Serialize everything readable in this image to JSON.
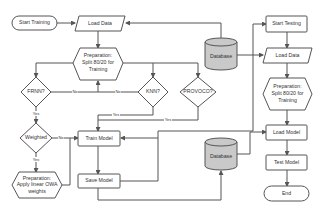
{
  "diagram": {
    "type": "flowchart",
    "colors": {
      "stroke": "#555555",
      "node_fill": "#ffffff",
      "database_fill": "#c9c9c9",
      "text": "#333333"
    },
    "training": {
      "start": "Start Training",
      "load_data": "Load Data",
      "prep_split": [
        "Preparation:",
        "Split 80/20 for",
        "Training"
      ],
      "frnn": "FRNN?",
      "knn": "KNN?",
      "provoco": "PROVOCO?",
      "weighted": "Weighted",
      "prep_owa": [
        "Preparation:",
        "Apply linear OWA",
        "weights"
      ],
      "train_model": "Train Model",
      "save_model": "Save Model"
    },
    "databases": {
      "top": "Database",
      "bottom": "Database"
    },
    "testing": {
      "start": "Start Testing",
      "load_data": "Load Data",
      "prep_split": [
        "Preparation:",
        "Split 80/20 for",
        "Training"
      ],
      "load_model": "Load Model",
      "test_model": "Test Model",
      "end": "End"
    },
    "edge_labels": {
      "frnn_no": "No",
      "knn_no": "No",
      "knn_yes": "Yes",
      "provoco_yes": "Yes",
      "frnn_yes": "Yes",
      "weighted_no": "No",
      "weighted_yes": "Yes"
    }
  }
}
